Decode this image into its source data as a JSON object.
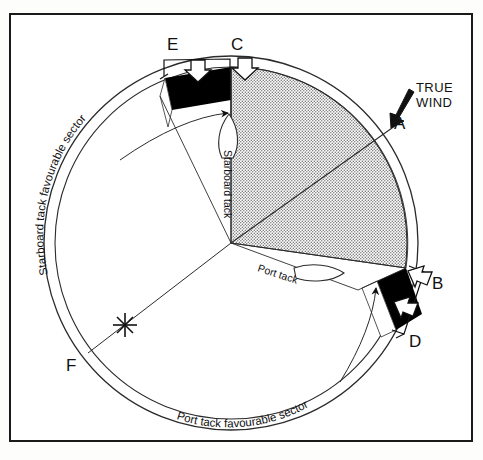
{
  "figure": {
    "center_label": "",
    "annotations": {
      "true_wind_line1": "TRUE",
      "true_wind_line2": "WIND",
      "starboard_sector": "Starboard tack favourable sector",
      "port_sector": "Port  tack  favourable  sector",
      "starboard_tack": "Starboard tack",
      "port_tack": "Port tack"
    },
    "points": [
      {
        "id": "A",
        "label": "A",
        "x": 399,
        "y": 123
      },
      {
        "id": "B",
        "label": "B",
        "x": 437,
        "y": 282
      },
      {
        "id": "C",
        "label": "C",
        "x": 237,
        "y": 44
      },
      {
        "id": "D",
        "label": "D",
        "x": 414,
        "y": 340
      },
      {
        "id": "E",
        "label": "E",
        "x": 173,
        "y": 44
      },
      {
        "id": "F",
        "label": "F",
        "x": 72,
        "y": 364
      }
    ],
    "colors": {
      "ink": "#111111",
      "frame": "#1a1a1a",
      "band_fill": "#000000",
      "stipple": "#8d8d8d",
      "paper": "#ffffff"
    },
    "geometry": {
      "center_x": 231,
      "center_y": 243,
      "outer_radius": 187,
      "inner_radius": 176,
      "sector_radius": 172
    }
  }
}
